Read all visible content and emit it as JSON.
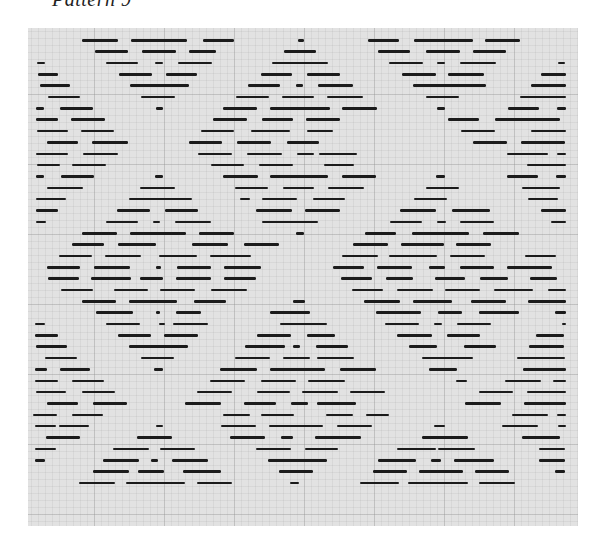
{
  "page": {
    "title": "Pattern 9"
  },
  "draft": {
    "paper_color": "#e2e2e2",
    "ink_color": "#1b1b1b",
    "row_start_y": 39,
    "row_spacing": 11.35,
    "rows": [
      [
        [
          82,
          118
        ],
        [
          131,
          187
        ],
        [
          203,
          234
        ],
        [
          298,
          304
        ],
        [
          368,
          399
        ],
        [
          414,
          473
        ],
        [
          485,
          520
        ]
      ],
      [
        [
          95,
          128
        ],
        [
          142,
          176
        ],
        [
          189,
          216
        ],
        [
          284,
          316
        ],
        [
          378,
          410
        ],
        [
          426,
          460
        ],
        [
          473,
          506
        ]
      ],
      [
        [
          37,
          45
        ],
        [
          106,
          138
        ],
        [
          155,
          163
        ],
        [
          178,
          212
        ],
        [
          272,
          328
        ],
        [
          389,
          423
        ],
        [
          437,
          445
        ],
        [
          460,
          496
        ],
        [
          558,
          565
        ]
      ],
      [
        [
          38,
          58
        ],
        [
          119,
          152
        ],
        [
          166,
          197
        ],
        [
          261,
          292
        ],
        [
          307,
          340
        ],
        [
          402,
          436
        ],
        [
          448,
          484
        ],
        [
          541,
          566
        ]
      ],
      [
        [
          40,
          70
        ],
        [
          130,
          189
        ],
        [
          248,
          280
        ],
        [
          296,
          303
        ],
        [
          318,
          353
        ],
        [
          413,
          486
        ],
        [
          531,
          566
        ]
      ],
      [
        [
          48,
          80
        ],
        [
          141,
          175
        ],
        [
          236,
          269
        ],
        [
          282,
          314
        ],
        [
          327,
          363
        ],
        [
          426,
          459
        ],
        [
          520,
          566
        ]
      ],
      [
        [
          36,
          44
        ],
        [
          60,
          93
        ],
        [
          156,
          163
        ],
        [
          223,
          257
        ],
        [
          270,
          330
        ],
        [
          342,
          377
        ],
        [
          437,
          445
        ],
        [
          508,
          539
        ],
        [
          557,
          566
        ]
      ],
      [
        [
          36,
          58
        ],
        [
          71,
          105
        ],
        [
          213,
          247
        ],
        [
          262,
          293
        ],
        [
          306,
          340
        ],
        [
          448,
          479
        ],
        [
          495,
          560
        ]
      ],
      [
        [
          37,
          68
        ],
        [
          81,
          114
        ],
        [
          201,
          234
        ],
        [
          251,
          290
        ],
        [
          307,
          333
        ],
        [
          461,
          495
        ],
        [
          531,
          566
        ]
      ],
      [
        [
          47,
          78
        ],
        [
          92,
          128
        ],
        [
          189,
          222
        ],
        [
          237,
          271
        ],
        [
          287,
          319
        ],
        [
          473,
          507
        ],
        [
          521,
          565
        ]
      ],
      [
        [
          36,
          68
        ],
        [
          83,
          118
        ],
        [
          198,
          232
        ],
        [
          247,
          282
        ],
        [
          297,
          314
        ],
        [
          319,
          357
        ],
        [
          507,
          548
        ],
        [
          557,
          566
        ]
      ],
      [
        [
          37,
          60
        ],
        [
          72,
          106
        ],
        [
          211,
          244
        ],
        [
          259,
          293
        ],
        [
          324,
          354
        ],
        [
          527,
          559
        ],
        [
          543,
          566
        ]
      ],
      [
        [
          36,
          44
        ],
        [
          61,
          94
        ],
        [
          155,
          163
        ],
        [
          223,
          258
        ],
        [
          270,
          328
        ],
        [
          342,
          376
        ],
        [
          436,
          445
        ],
        [
          507,
          538
        ],
        [
          556,
          566
        ]
      ],
      [
        [
          47,
          83
        ],
        [
          140,
          175
        ],
        [
          235,
          268
        ],
        [
          283,
          314
        ],
        [
          328,
          364
        ],
        [
          426,
          459
        ],
        [
          522,
          560
        ]
      ],
      [
        [
          36,
          66
        ],
        [
          129,
          192
        ],
        [
          240,
          250
        ],
        [
          262,
          297
        ],
        [
          313,
          345
        ],
        [
          414,
          447
        ],
        [
          528,
          558
        ]
      ],
      [
        [
          36,
          58
        ],
        [
          117,
          150
        ],
        [
          165,
          198
        ],
        [
          256,
          292
        ],
        [
          305,
          340
        ],
        [
          400,
          436
        ],
        [
          452,
          490
        ],
        [
          541,
          566
        ]
      ],
      [
        [
          36,
          46
        ],
        [
          106,
          138
        ],
        [
          153,
          160
        ],
        [
          175,
          211
        ],
        [
          262,
          318
        ],
        [
          390,
          422
        ],
        [
          437,
          446
        ],
        [
          460,
          494
        ],
        [
          551,
          566
        ]
      ],
      [
        [
          82,
          117
        ],
        [
          130,
          186
        ],
        [
          199,
          234
        ],
        [
          296,
          304
        ],
        [
          365,
          396
        ],
        [
          412,
          469
        ],
        [
          483,
          519
        ]
      ],
      [
        [
          72,
          104
        ],
        [
          118,
          156
        ],
        [
          192,
          228
        ],
        [
          244,
          279
        ],
        [
          353,
          388
        ],
        [
          401,
          444
        ],
        [
          456,
          491
        ]
      ],
      [
        [
          59,
          92
        ],
        [
          105,
          141
        ],
        [
          159,
          197
        ],
        [
          210,
          251
        ],
        [
          342,
          378
        ],
        [
          389,
          437
        ],
        [
          450,
          485
        ],
        [
          525,
          556
        ]
      ],
      [
        [
          47,
          80
        ],
        [
          94,
          130
        ],
        [
          156,
          161
        ],
        [
          177,
          211
        ],
        [
          224,
          261
        ],
        [
          333,
          364
        ],
        [
          377,
          412
        ],
        [
          429,
          445
        ],
        [
          460,
          494
        ],
        [
          507,
          552
        ]
      ],
      [
        [
          48,
          79
        ],
        [
          91,
          131
        ],
        [
          140,
          163
        ],
        [
          176,
          211
        ],
        [
          224,
          256
        ],
        [
          341,
          372
        ],
        [
          386,
          413
        ],
        [
          435,
          465
        ],
        [
          480,
          508
        ],
        [
          530,
          557
        ]
      ],
      [
        [
          61,
          93
        ],
        [
          114,
          148
        ],
        [
          160,
          195
        ],
        [
          211,
          247
        ],
        [
          352,
          383
        ],
        [
          397,
          433
        ],
        [
          445,
          480
        ],
        [
          494,
          533
        ],
        [
          548,
          566
        ]
      ],
      [
        [
          82,
          116
        ],
        [
          129,
          177
        ],
        [
          194,
          226
        ],
        [
          293,
          305
        ],
        [
          364,
          400
        ],
        [
          413,
          452
        ],
        [
          471,
          506
        ],
        [
          528,
          566
        ]
      ],
      [
        [
          96,
          133
        ],
        [
          156,
          160
        ],
        [
          176,
          201
        ],
        [
          270,
          310
        ],
        [
          376,
          421
        ],
        [
          438,
          462
        ],
        [
          479,
          519
        ],
        [
          555,
          566
        ]
      ],
      [
        [
          35,
          45
        ],
        [
          106,
          140
        ],
        [
          159,
          165
        ],
        [
          173,
          208
        ],
        [
          280,
          327
        ],
        [
          385,
          419
        ],
        [
          434,
          442
        ],
        [
          457,
          491
        ],
        [
          562,
          566
        ]
      ],
      [
        [
          35,
          58
        ],
        [
          118,
          151
        ],
        [
          164,
          198
        ],
        [
          257,
          291
        ],
        [
          307,
          335
        ],
        [
          397,
          432
        ],
        [
          447,
          480
        ],
        [
          536,
          564
        ]
      ],
      [
        [
          36,
          67
        ],
        [
          129,
          188
        ],
        [
          245,
          285
        ],
        [
          293,
          300
        ],
        [
          316,
          348
        ],
        [
          409,
          437
        ],
        [
          464,
          496
        ],
        [
          529,
          564
        ]
      ],
      [
        [
          45,
          77
        ],
        [
          141,
          174
        ],
        [
          235,
          270
        ],
        [
          283,
          310
        ],
        [
          317,
          354
        ],
        [
          422,
          473
        ],
        [
          517,
          565
        ]
      ],
      [
        [
          35,
          47
        ],
        [
          60,
          90
        ],
        [
          154,
          163
        ],
        [
          220,
          257
        ],
        [
          270,
          325
        ],
        [
          340,
          376
        ],
        [
          429,
          457
        ],
        [
          523,
          561
        ],
        [
          552,
          566
        ]
      ],
      [
        [
          35,
          58
        ],
        [
          72,
          104
        ],
        [
          210,
          245
        ],
        [
          261,
          296
        ],
        [
          308,
          345
        ],
        [
          456,
          467
        ],
        [
          505,
          541
        ],
        [
          553,
          566
        ]
      ],
      [
        [
          36,
          66
        ],
        [
          82,
          115
        ],
        [
          197,
          232
        ],
        [
          257,
          290
        ],
        [
          302,
          338
        ],
        [
          350,
          385
        ],
        [
          479,
          513
        ],
        [
          527,
          566
        ]
      ],
      [
        [
          47,
          78
        ],
        [
          93,
          127
        ],
        [
          185,
          221
        ],
        [
          244,
          276
        ],
        [
          291,
          308
        ],
        [
          317,
          356
        ],
        [
          465,
          501
        ],
        [
          524,
          566
        ]
      ],
      [
        [
          33,
          57
        ],
        [
          72,
          103
        ],
        [
          223,
          250
        ],
        [
          261,
          294
        ],
        [
          326,
          353
        ],
        [
          366,
          389
        ],
        [
          512,
          548
        ],
        [
          557,
          566
        ]
      ],
      [
        [
          35,
          56
        ],
        [
          59,
          89
        ],
        [
          156,
          163
        ],
        [
          221,
          256
        ],
        [
          269,
          323
        ],
        [
          337,
          372
        ],
        [
          434,
          445
        ],
        [
          502,
          538
        ],
        [
          558,
          566
        ]
      ],
      [
        [
          46,
          80
        ],
        [
          137,
          172
        ],
        [
          230,
          265
        ],
        [
          281,
          293
        ],
        [
          315,
          361
        ],
        [
          422,
          468
        ],
        [
          522,
          560
        ]
      ],
      [
        [
          35,
          56
        ],
        [
          113,
          149
        ],
        [
          160,
          195
        ],
        [
          256,
          291
        ],
        [
          305,
          338
        ],
        [
          397,
          436
        ],
        [
          438,
          475
        ],
        [
          539,
          565
        ]
      ],
      [
        [
          35,
          45
        ],
        [
          103,
          139
        ],
        [
          151,
          158
        ],
        [
          172,
          208
        ],
        [
          268,
          327
        ],
        [
          378,
          416
        ],
        [
          431,
          441
        ],
        [
          454,
          494
        ],
        [
          539,
          565
        ]
      ],
      [
        [
          93,
          129
        ],
        [
          138,
          164
        ],
        [
          183,
          221
        ],
        [
          279,
          313
        ],
        [
          373,
          407
        ],
        [
          419,
          463
        ],
        [
          475,
          509
        ],
        [
          555,
          565
        ]
      ],
      [
        [
          79,
          115
        ],
        [
          126,
          185
        ],
        [
          197,
          232
        ],
        [
          290,
          299
        ],
        [
          360,
          399
        ],
        [
          408,
          468
        ],
        [
          479,
          515
        ]
      ]
    ]
  }
}
